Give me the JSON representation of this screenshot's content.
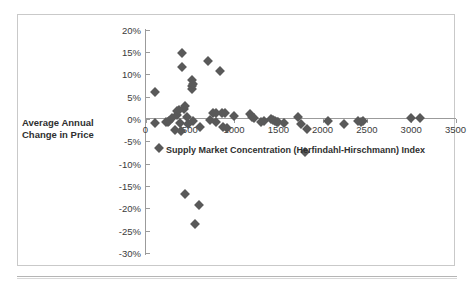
{
  "figure": {
    "marker_color": "#595959",
    "axis_color": "#9b9b9b",
    "axis_title_y_line1": "Average Annual",
    "axis_title_y_line2": "Change in Price",
    "axis_title_x": "Supply Market Concentration (Herfindahl-Hirschmann) Index"
  },
  "chart_data": {
    "type": "scatter",
    "title": "",
    "xlabel": "Supply Market Concentration (Herfindahl-Hirschmann) Index",
    "ylabel": "Average Annual Change in Price",
    "xlim": [
      0,
      3500
    ],
    "ylim": [
      -30,
      20
    ],
    "grid": false,
    "legend": "none",
    "x_ticks": [
      0,
      500,
      1000,
      1500,
      2000,
      2500,
      3000,
      3500
    ],
    "x_tick_labels": [
      "0",
      "500",
      "1000",
      "1500",
      "2000",
      "2500",
      "3000",
      "3500"
    ],
    "y_ticks": [
      20,
      15,
      10,
      5,
      0,
      -5,
      -10,
      -15,
      -20,
      -25,
      -30
    ],
    "y_tick_labels": [
      "20%",
      "15%",
      "10%",
      "5%",
      "0%",
      "-5%",
      "-10%",
      "-15%",
      "-20%",
      "-25%",
      "-30%"
    ],
    "y_unit": "percent",
    "series": [
      {
        "name": "Products",
        "marker": "diamond",
        "color": "#595959",
        "points": [
          [
            110,
            6.0
          ],
          [
            110,
            -1.0
          ],
          [
            150,
            -6.5
          ],
          [
            230,
            -0.7
          ],
          [
            255,
            -0.6
          ],
          [
            270,
            -0.4
          ],
          [
            300,
            0.3
          ],
          [
            330,
            -2.5
          ],
          [
            350,
            0.9
          ],
          [
            360,
            1.7
          ],
          [
            380,
            2.1
          ],
          [
            385,
            -1.0
          ],
          [
            400,
            -2.6
          ],
          [
            410,
            14.7
          ],
          [
            415,
            11.7
          ],
          [
            430,
            2.2
          ],
          [
            440,
            3.0
          ],
          [
            450,
            -16.7
          ],
          [
            470,
            0.4
          ],
          [
            480,
            -1.1
          ],
          [
            520,
            8.7
          ],
          [
            525,
            7.3
          ],
          [
            530,
            6.6
          ],
          [
            535,
            7.8
          ],
          [
            540,
            -0.4
          ],
          [
            560,
            -23.6
          ],
          [
            600,
            -19.2
          ],
          [
            620,
            -1.9
          ],
          [
            700,
            12.9
          ],
          [
            730,
            -0.3
          ],
          [
            760,
            1.4
          ],
          [
            790,
            1.3
          ],
          [
            800,
            -0.6
          ],
          [
            840,
            10.7
          ],
          [
            860,
            1.4
          ],
          [
            880,
            -1.7
          ],
          [
            900,
            1.3
          ],
          [
            920,
            -2.1
          ],
          [
            1000,
            0.6
          ],
          [
            1180,
            1.1
          ],
          [
            1200,
            0.4
          ],
          [
            1230,
            0.2
          ],
          [
            1300,
            -0.6
          ],
          [
            1340,
            -0.4
          ],
          [
            1420,
            0.1
          ],
          [
            1440,
            -0.3
          ],
          [
            1460,
            -0.5
          ],
          [
            1480,
            -0.6
          ],
          [
            1500,
            -0.7
          ],
          [
            1560,
            -1.0
          ],
          [
            1720,
            0.5
          ],
          [
            1760,
            -1.2
          ],
          [
            1800,
            -7.4
          ],
          [
            1820,
            -2.3
          ],
          [
            2060,
            -0.5
          ],
          [
            2240,
            -1.1
          ],
          [
            2400,
            -0.5
          ],
          [
            2430,
            -0.6
          ],
          [
            2460,
            -0.4
          ],
          [
            3000,
            0.2
          ],
          [
            3100,
            0.3
          ]
        ]
      }
    ]
  }
}
